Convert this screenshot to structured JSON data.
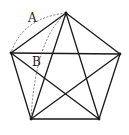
{
  "figure": {
    "labels": [
      {
        "id": "A",
        "text": "A",
        "x": 30,
        "y": 12
      },
      {
        "id": "B",
        "text": "B",
        "x": 32,
        "y": 56
      }
    ],
    "vertices": {
      "top": [
        66,
        13
      ],
      "left": [
        11,
        53
      ],
      "right": [
        120,
        54
      ],
      "bottom_left": [
        31,
        119
      ],
      "bottom_right": [
        99,
        119
      ]
    },
    "colors": {
      "stroke": "#1a1a1a",
      "dashed": "#555555",
      "background": "#ffffff"
    }
  }
}
